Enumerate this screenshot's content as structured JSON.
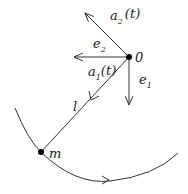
{
  "diagram": {
    "points": {
      "origin": {
        "label": "0"
      },
      "mass": {
        "label": "m"
      }
    },
    "vectors": {
      "a2": {
        "base": "a",
        "sub": "2",
        "arg": "(t)"
      },
      "a1": {
        "base": "a",
        "sub": "1",
        "arg": "(t)"
      },
      "e2": {
        "base": "e",
        "sub": "2"
      },
      "e1": {
        "base": "e",
        "sub": "1"
      }
    },
    "rod": {
      "label": "l"
    },
    "colors": {
      "stroke": "#333333",
      "dot": "#000000"
    }
  }
}
